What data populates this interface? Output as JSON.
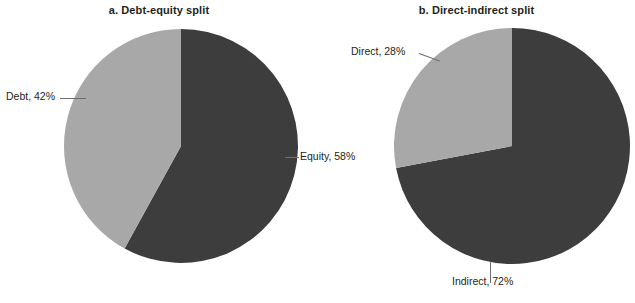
{
  "figure": {
    "background_color": "#ffffff",
    "text_color": "#231f20",
    "leader_color": "#6f6f6f"
  },
  "panels": [
    {
      "id": "a",
      "title": "a. Debt-equity split",
      "labels": {
        "light": "Debt, 42%",
        "dark": "Equity, 58%"
      }
    },
    {
      "id": "b",
      "title": "b. Direct-indirect split",
      "labels": {
        "light": "Direct, 28%",
        "dark": "Indirect, 72%"
      }
    }
  ],
  "chart_data": [
    {
      "type": "pie",
      "title": "a. Debt-equity split",
      "labels": [
        "Equity",
        "Debt"
      ],
      "values": [
        58,
        42
      ],
      "value_unit": "%",
      "data_labels": [
        "Equity, 58%",
        "Debt, 42%"
      ],
      "colors": [
        "#3d3d3d",
        "#a8a8a8"
      ],
      "start_angle_deg": 0,
      "direction": "clockwise",
      "legend": "none",
      "grid": false,
      "center_px": [
        181,
        146
      ],
      "radius_px": 117
    },
    {
      "type": "pie",
      "title": "b. Direct-indirect split",
      "labels": [
        "Indirect",
        "Direct"
      ],
      "values": [
        72,
        28
      ],
      "value_unit": "%",
      "data_labels": [
        "Indirect, 72%",
        "Direct, 28%"
      ],
      "colors": [
        "#3d3d3d",
        "#a8a8a8"
      ],
      "start_angle_deg": 0,
      "direction": "clockwise",
      "legend": "none",
      "grid": false,
      "center_px": [
        512,
        146
      ],
      "radius_px": 118
    }
  ]
}
